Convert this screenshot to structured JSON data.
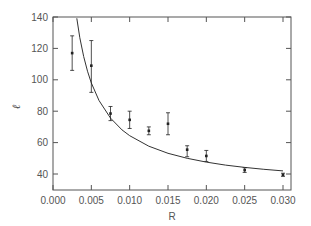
{
  "chart_data": {
    "type": "scatter",
    "title": "",
    "xlabel": "R",
    "ylabel": "ℓ",
    "xlim": [
      0.0,
      0.031
    ],
    "ylim": [
      30,
      140
    ],
    "grid": false,
    "legend": null,
    "x_ticks": [
      "0.000",
      "0.005",
      "0.010",
      "0.015",
      "0.020",
      "0.025",
      "0.030"
    ],
    "y_ticks": [
      "40",
      "60",
      "80",
      "100",
      "120",
      "140"
    ],
    "series": [
      {
        "name": "data",
        "kind": "errorbar",
        "x": [
          0.0025,
          0.005,
          0.0075,
          0.01,
          0.0125,
          0.015,
          0.0175,
          0.02,
          0.025,
          0.03
        ],
        "y": [
          117,
          109,
          78.5,
          74.5,
          67.5,
          72,
          55.5,
          51.5,
          42.5,
          39.5
        ],
        "y_low": [
          106,
          92,
          74,
          69,
          65,
          65,
          51,
          48,
          41,
          38.5
        ],
        "y_high": [
          128,
          125,
          83,
          80,
          70,
          79,
          58,
          55,
          44,
          40.5
        ]
      },
      {
        "name": "fit",
        "kind": "line",
        "x": [
          0.0031,
          0.0035,
          0.004,
          0.0045,
          0.005,
          0.006,
          0.0075,
          0.009,
          0.01,
          0.0125,
          0.015,
          0.0175,
          0.02,
          0.0225,
          0.025,
          0.0275,
          0.03
        ],
        "y": [
          139.2,
          126.8,
          114.8,
          105.5,
          98.0,
          86.8,
          75.6,
          68.1,
          64.4,
          57.7,
          53.2,
          50.0,
          47.6,
          45.7,
          44.2,
          43.0,
          42.0
        ]
      }
    ],
    "colors": {
      "axis": "#555555",
      "data": "#222222",
      "line": "#333333"
    }
  }
}
